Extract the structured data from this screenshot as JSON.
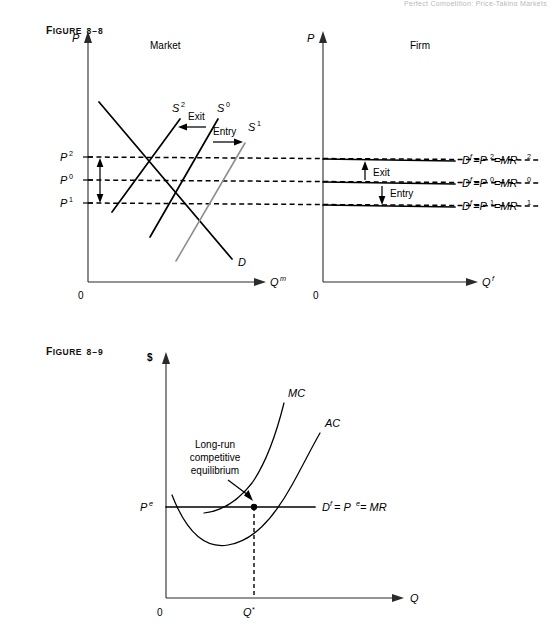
{
  "page": {
    "running_head": "Perfect Competition: Price-Taking Markets"
  },
  "figure_8_8": {
    "label_word": "F",
    "label_word_rest": "IGURE",
    "label_number": "8–8",
    "panels": [
      {
        "name": "market",
        "title": "Market",
        "y_axis_label": "P",
        "x_axis_label": "Q",
        "x_axis_sup": "m",
        "origin_label": "0",
        "price_ticks": [
          {
            "label": "P",
            "sup": "2",
            "value": "P2"
          },
          {
            "label": "P",
            "sup": "0",
            "value": "P0"
          },
          {
            "label": "P",
            "sup": "1",
            "value": "P1"
          }
        ],
        "curves": [
          {
            "name": "demand",
            "label": "D",
            "sup": ""
          },
          {
            "name": "supply-0",
            "label": "S",
            "sup": "0"
          },
          {
            "name": "supply-1",
            "label": "S",
            "sup": "1"
          },
          {
            "name": "supply-2",
            "label": "S",
            "sup": "2"
          }
        ],
        "annotations": [
          {
            "name": "exit-arrow",
            "text": "Exit"
          },
          {
            "name": "entry-arrow",
            "text": "Entry"
          }
        ]
      },
      {
        "name": "firm",
        "title": "Firm",
        "y_axis_label": "P",
        "x_axis_label": "Q",
        "x_axis_sup": "f",
        "origin_label": "0",
        "demand_lines": [
          {
            "name": "mr2",
            "d": "D",
            "d_sup": "f",
            "eq1": "=P",
            "p_sup": "2",
            "eq2": "=MR",
            "mr_sup": "2"
          },
          {
            "name": "mr0",
            "d": "D",
            "d_sup": "f",
            "eq1": "=P",
            "p_sup": "0",
            "eq2": "=MR",
            "mr_sup": "0"
          },
          {
            "name": "mr1",
            "d": "D",
            "d_sup": "f",
            "eq1": "=P",
            "p_sup": "1",
            "eq2": "=MR",
            "mr_sup": "1"
          }
        ],
        "annotations": [
          {
            "name": "exit-arrow",
            "text": "Exit"
          },
          {
            "name": "entry-arrow",
            "text": "Entry"
          }
        ]
      }
    ]
  },
  "figure_8_9": {
    "label_word": "F",
    "label_word_rest": "IGURE",
    "label_number": "8–9",
    "y_axis_label": "$",
    "x_axis_label": "Q",
    "origin_label": "0",
    "price_tick": {
      "label": "P",
      "sup": "e"
    },
    "quantity_tick": {
      "label": "Q",
      "sup": "*"
    },
    "curves": [
      {
        "name": "marginal-cost",
        "label": "MC"
      },
      {
        "name": "average-cost",
        "label": "AC"
      },
      {
        "name": "demand-mr",
        "d": "D",
        "d_sup": "f",
        "eq1": "= P",
        "p_sup": "e",
        "eq2": "= MR"
      }
    ],
    "annotation": {
      "name": "long-run-equilibrium-note",
      "line1": "Long-run",
      "line2": "competitive",
      "line3": "equilibrium"
    }
  },
  "colors": {
    "ink": "#000000",
    "axis": "#2b2b2b",
    "gray_curve": "#8e8e8e",
    "background": "#ffffff"
  }
}
